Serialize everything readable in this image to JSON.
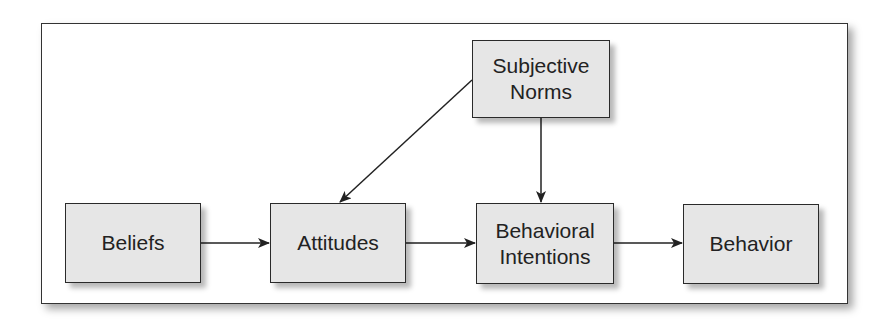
{
  "diagram": {
    "type": "flowchart",
    "nodes": [
      {
        "id": "subjective-norms",
        "label": "Subjective\nNorms"
      },
      {
        "id": "beliefs",
        "label": "Beliefs"
      },
      {
        "id": "attitudes",
        "label": "Attitudes"
      },
      {
        "id": "behavioral-intentions",
        "label": "Behavioral\nIntentions"
      },
      {
        "id": "behavior",
        "label": "Behavior"
      }
    ],
    "edges": [
      {
        "from": "beliefs",
        "to": "attitudes"
      },
      {
        "from": "attitudes",
        "to": "behavioral-intentions"
      },
      {
        "from": "behavioral-intentions",
        "to": "behavior"
      },
      {
        "from": "subjective-norms",
        "to": "attitudes"
      },
      {
        "from": "subjective-norms",
        "to": "behavioral-intentions"
      }
    ],
    "colors": {
      "box_fill": "#e6e6e6",
      "border": "#2a2a2a",
      "text": "#222222"
    }
  }
}
